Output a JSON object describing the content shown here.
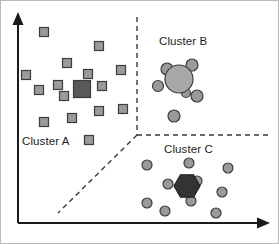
{
  "figure": {
    "kind": "cluster-scatter-diagram",
    "width": 279,
    "height": 244,
    "background": "#ffffff",
    "border_color": "#b9b9b9"
  },
  "axes": {
    "color": "#1a1a1a",
    "line_width": 2,
    "y_axis": {
      "x": 17,
      "y_top": 14,
      "y_bottom": 222,
      "arrow": "up"
    },
    "x_axis": {
      "y": 222,
      "x_left": 17,
      "x_right": 266,
      "arrow": "right"
    },
    "xlabel": "",
    "ylabel": "",
    "ticks": []
  },
  "dividers": {
    "color": "#3a3a3a",
    "dash": "5,4",
    "line_width": 1.4,
    "segments": [
      {
        "name": "vertical-divider",
        "x1": 136,
        "y1": 16,
        "x2": 136,
        "y2": 134
      },
      {
        "name": "horizontal-divider",
        "x1": 136,
        "y1": 134,
        "x2": 268,
        "y2": 134
      },
      {
        "name": "diagonal-divider",
        "x1": 136,
        "y1": 134,
        "x2": 57,
        "y2": 212
      }
    ]
  },
  "labels": [
    {
      "name": "cluster-a-label",
      "text": "Cluster A",
      "x": 21,
      "y": 134
    },
    {
      "name": "cluster-b-label",
      "text": "Cluster B",
      "x": 158,
      "y": 34
    },
    {
      "name": "cluster-c-label",
      "text": "Cluster C",
      "x": 163,
      "y": 142
    }
  ],
  "style": {
    "member_fill": "#9a9a9a",
    "member_stroke": "#3c3c3c",
    "centroid_square_fill": "#595959",
    "centroid_circle_fill": "#a8a8a8",
    "centroid_hex_fill": "#333333",
    "marker_stroke_width": 1.2
  },
  "chart_data": {
    "type": "scatter",
    "title": "",
    "xlabel": "",
    "ylabel": "",
    "xlim": [
      0,
      279
    ],
    "ylim": [
      244,
      0
    ],
    "grid": false,
    "legend": "none",
    "annotations": [
      "Cluster A",
      "Cluster B",
      "Cluster C"
    ],
    "series": [
      {
        "name": "Cluster A",
        "marker": "square",
        "fill": "#9a9a9a",
        "points": [
          {
            "x": 43,
            "y": 31,
            "size": 9
          },
          {
            "x": 98,
            "y": 45,
            "size": 9
          },
          {
            "x": 66,
            "y": 62,
            "size": 9
          },
          {
            "x": 25,
            "y": 74,
            "size": 9
          },
          {
            "x": 87,
            "y": 73,
            "size": 9
          },
          {
            "x": 120,
            "y": 69,
            "size": 9
          },
          {
            "x": 57,
            "y": 84,
            "size": 9
          },
          {
            "x": 101,
            "y": 85,
            "size": 9
          },
          {
            "x": 38,
            "y": 89,
            "size": 9
          },
          {
            "x": 63,
            "y": 95,
            "size": 9
          },
          {
            "x": 98,
            "y": 110,
            "size": 9
          },
          {
            "x": 122,
            "y": 108,
            "size": 9
          },
          {
            "x": 71,
            "y": 117,
            "size": 9
          },
          {
            "x": 43,
            "y": 121,
            "size": 9
          },
          {
            "x": 88,
            "y": 139,
            "size": 9
          }
        ],
        "centroid": {
          "x": 81,
          "y": 88,
          "size": 17,
          "marker": "square",
          "fill": "#595959"
        }
      },
      {
        "name": "Cluster B",
        "marker": "circle",
        "fill": "#9a9a9a",
        "points": [
          {
            "x": 166,
            "y": 68,
            "r": 6
          },
          {
            "x": 191,
            "y": 64,
            "r": 6
          },
          {
            "x": 157,
            "y": 85,
            "r": 5.5
          },
          {
            "x": 185,
            "y": 92,
            "r": 4.5
          },
          {
            "x": 196,
            "y": 95,
            "r": 6
          },
          {
            "x": 173,
            "y": 115,
            "r": 6
          }
        ],
        "centroid": {
          "x": 178,
          "y": 78,
          "r": 14,
          "marker": "circle",
          "fill": "#a8a8a8"
        }
      },
      {
        "name": "Cluster C",
        "marker": "circle",
        "fill": "#9a9a9a",
        "points": [
          {
            "x": 146,
            "y": 164,
            "r": 5
          },
          {
            "x": 188,
            "y": 162,
            "r": 5
          },
          {
            "x": 227,
            "y": 167,
            "r": 5
          },
          {
            "x": 167,
            "y": 183,
            "r": 5
          },
          {
            "x": 196,
            "y": 180,
            "r": 5
          },
          {
            "x": 221,
            "y": 191,
            "r": 5
          },
          {
            "x": 146,
            "y": 202,
            "r": 5
          },
          {
            "x": 190,
            "y": 200,
            "r": 5
          },
          {
            "x": 164,
            "y": 210,
            "r": 5
          },
          {
            "x": 215,
            "y": 212,
            "r": 5
          }
        ],
        "centroid": {
          "x": 186,
          "y": 185,
          "r": 13,
          "marker": "hexagon",
          "fill": "#333333"
        }
      }
    ]
  }
}
